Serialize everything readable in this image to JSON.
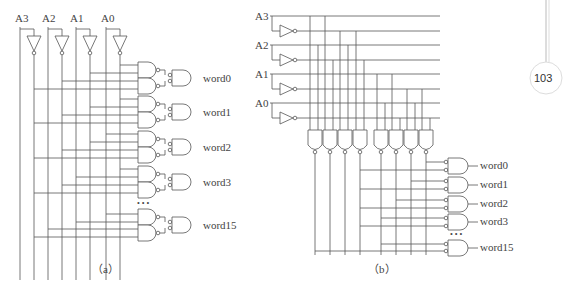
{
  "figure_a": {
    "inputs": [
      "A3",
      "A2",
      "A1",
      "A0"
    ],
    "outputs": [
      "word0",
      "word1",
      "word2",
      "word3",
      "word15"
    ],
    "ellipsis": "• • •",
    "caption": "（a）"
  },
  "figure_b": {
    "inputs": [
      "A3",
      "A2",
      "A1",
      "A0"
    ],
    "outputs": [
      "word0",
      "word1",
      "word2",
      "word3",
      "word15"
    ],
    "ellipsis": "• • •",
    "caption": "（b）"
  },
  "page_number": "103"
}
